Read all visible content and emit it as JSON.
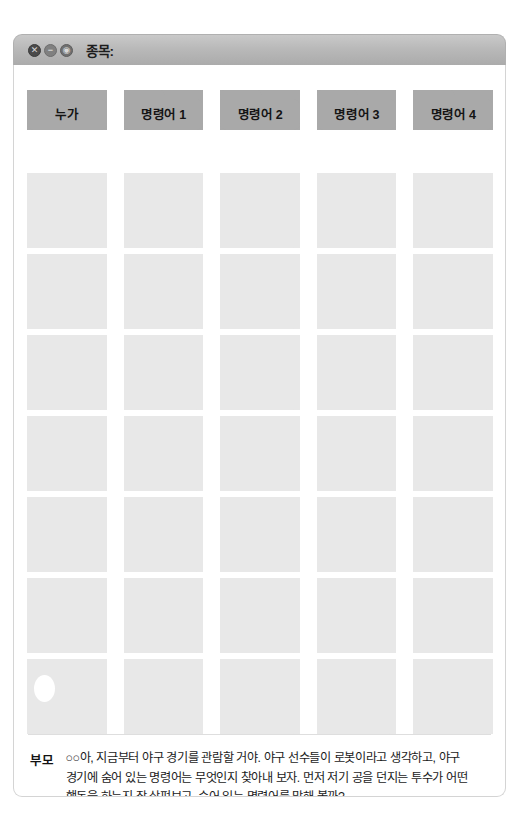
{
  "window": {
    "title": "종목:",
    "buttons": [
      {
        "name": "close-button",
        "glyph": "✕"
      },
      {
        "name": "minimize-button",
        "glyph": "−"
      },
      {
        "name": "maximize-button",
        "glyph": "◉"
      }
    ]
  },
  "columns": [
    {
      "label": "누가"
    },
    {
      "label": "명령어 1"
    },
    {
      "label": "명령어 2"
    },
    {
      "label": "명령어 3"
    },
    {
      "label": "명령어 4"
    }
  ],
  "grid": {
    "rows": 7,
    "cols": 5,
    "highlight": {
      "row": 7,
      "col": 1
    }
  },
  "caption": {
    "speaker": "부모",
    "text": "○○아, 지금부터 야구 경기를 관람할 거야. 야구 선수들이 로봇이라고 생각하고, 야구 경기에 숨어 있는 명령어는 무엇인지 찾아내 보자. 먼저 저기 공을 던지는 투수가 어떤 행동을 하는지 잘 살펴보고, 숨어 있는 명령어를 말해 볼까?"
  },
  "colors": {
    "titlebar": "#b9b9b9",
    "header_tab": "#a9a9a9",
    "cell": "#e8e8e8",
    "panel_bg": "#ffffff",
    "divider": "#dedede"
  }
}
